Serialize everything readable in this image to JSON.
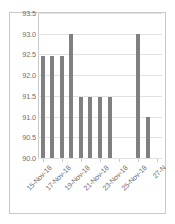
{
  "chart_data": {
    "type": "bar",
    "title": "",
    "xlabel": "",
    "ylabel": "",
    "categories": [
      "15-Nov-18",
      "16-Nov-18",
      "17-Nov-18",
      "18-Nov-18",
      "19-Nov-18",
      "20-Nov-18",
      "21-Nov-18",
      "22-Nov-18",
      "23-Nov-18",
      "24-Nov-18",
      "25-Nov-18",
      "26-Nov-18",
      "27-Nov-18"
    ],
    "values": [
      92.47,
      92.47,
      92.47,
      93.0,
      91.47,
      91.47,
      91.47,
      91.47,
      null,
      null,
      93.0,
      91.0,
      null
    ],
    "ylim": [
      90.0,
      93.5
    ],
    "y_ticks": [
      "93.5",
      "93.0",
      "92.5",
      "92.0",
      "91.5",
      "91.0",
      "90.5",
      "90.0"
    ],
    "y_tick_values": [
      93.5,
      93.0,
      92.5,
      92.0,
      91.5,
      91.0,
      90.5,
      90.0
    ],
    "x_tick_labels": [
      "15-Nov-18",
      "17-Nov-18",
      "19-Nov-18",
      "21-Nov-18",
      "23-Nov-18",
      "25-Nov-18",
      "27-N"
    ],
    "x_tick_indices": [
      0,
      2,
      4,
      6,
      8,
      10,
      12
    ],
    "grid": true,
    "legend": false,
    "legend_position": "none",
    "bar_color": "#808080",
    "grid_color": "#e2e2e2",
    "axis_color": "#c9c9c9",
    "tick_label_color": "#6f6f6f",
    "background_color": "#ffffff"
  }
}
